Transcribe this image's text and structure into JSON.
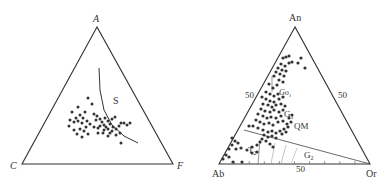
{
  "caption_top_fragment": "",
  "left_diagram": {
    "apex_labels": {
      "top": "A",
      "left": "C",
      "right": "F"
    },
    "region_label": "S",
    "vertices": {
      "top": [
        97,
        27
      ],
      "left": [
        22,
        164
      ],
      "right": [
        173,
        164
      ]
    },
    "boundary_curve": [
      [
        99,
        68
      ],
      [
        100,
        90
      ],
      [
        104,
        110
      ],
      [
        112,
        125
      ],
      [
        124,
        136
      ],
      [
        138,
        143
      ]
    ],
    "points": [
      [
        88,
        98
      ],
      [
        78,
        107
      ],
      [
        72,
        112
      ],
      [
        92,
        104
      ],
      [
        85,
        112
      ],
      [
        94,
        114
      ],
      [
        97,
        116
      ],
      [
        80,
        115
      ],
      [
        76,
        118
      ],
      [
        83,
        118
      ],
      [
        70,
        120
      ],
      [
        74,
        122
      ],
      [
        78,
        121
      ],
      [
        82,
        123
      ],
      [
        87,
        121
      ],
      [
        90,
        124
      ],
      [
        96,
        120
      ],
      [
        100,
        119
      ],
      [
        102,
        122
      ],
      [
        105,
        118
      ],
      [
        108,
        121
      ],
      [
        104,
        125
      ],
      [
        100,
        126
      ],
      [
        106,
        127
      ],
      [
        110,
        124
      ],
      [
        112,
        119
      ],
      [
        115,
        117
      ],
      [
        113,
        127
      ],
      [
        108,
        129
      ],
      [
        104,
        130
      ],
      [
        98,
        128
      ],
      [
        94,
        127
      ],
      [
        86,
        127
      ],
      [
        80,
        129
      ],
      [
        74,
        130
      ],
      [
        69,
        126
      ],
      [
        84,
        131
      ],
      [
        88,
        134
      ],
      [
        82,
        137
      ],
      [
        77,
        134
      ],
      [
        112,
        131
      ],
      [
        116,
        129
      ],
      [
        119,
        126
      ],
      [
        121,
        123
      ],
      [
        124,
        123
      ],
      [
        127,
        125
      ],
      [
        130,
        123
      ],
      [
        116,
        135
      ],
      [
        120,
        133
      ],
      [
        110,
        133
      ],
      [
        121,
        143
      ],
      [
        108,
        136
      ],
      [
        103,
        133
      ],
      [
        98,
        133
      ]
    ]
  },
  "right_diagram": {
    "apex_labels": {
      "top": "An",
      "left": "Ab",
      "right": "Or"
    },
    "tick_labels": {
      "left_edge": "50",
      "right_edge": "50",
      "base": "50"
    },
    "field_labels": {
      "QM": "QM",
      "G1": "G",
      "G1_sub": "1",
      "G2": "G",
      "G2_sub": "2",
      "T2": "T",
      "T2_sub": "2",
      "Go1": "Go",
      "Go1_sub": "1"
    },
    "vertices": {
      "top": [
        295,
        27
      ],
      "left": [
        219,
        164
      ],
      "right": [
        370,
        164
      ]
    },
    "divider_line": [
      [
        244,
        130
      ],
      [
        370,
        164
      ]
    ],
    "points": [
      [
        283,
        58
      ],
      [
        286,
        57
      ],
      [
        289,
        56
      ],
      [
        292,
        62
      ],
      [
        281,
        64
      ],
      [
        285,
        66
      ],
      [
        289,
        63
      ],
      [
        278,
        68
      ],
      [
        282,
        70
      ],
      [
        286,
        71
      ],
      [
        276,
        72
      ],
      [
        280,
        74
      ],
      [
        284,
        76
      ],
      [
        298,
        63
      ],
      [
        301,
        58
      ],
      [
        305,
        68
      ],
      [
        274,
        76
      ],
      [
        279,
        80
      ],
      [
        283,
        82
      ],
      [
        269,
        84
      ],
      [
        277,
        85
      ],
      [
        273,
        88
      ],
      [
        266,
        92
      ],
      [
        270,
        94
      ],
      [
        274,
        96
      ],
      [
        278,
        94
      ],
      [
        262,
        97
      ],
      [
        266,
        99
      ],
      [
        270,
        101
      ],
      [
        274,
        102
      ],
      [
        279,
        99
      ],
      [
        283,
        97
      ],
      [
        263,
        104
      ],
      [
        268,
        105
      ],
      [
        272,
        107
      ],
      [
        276,
        105
      ],
      [
        281,
        104
      ],
      [
        285,
        106
      ],
      [
        261,
        109
      ],
      [
        265,
        111
      ],
      [
        270,
        112
      ],
      [
        274,
        110
      ],
      [
        279,
        112
      ],
      [
        283,
        110
      ],
      [
        258,
        114
      ],
      [
        263,
        116
      ],
      [
        267,
        118
      ],
      [
        271,
        117
      ],
      [
        276,
        118
      ],
      [
        281,
        116
      ],
      [
        256,
        120
      ],
      [
        260,
        122
      ],
      [
        264,
        124
      ],
      [
        269,
        123
      ],
      [
        273,
        125
      ],
      [
        278,
        122
      ],
      [
        283,
        121
      ],
      [
        287,
        124
      ],
      [
        291,
        122
      ],
      [
        288,
        127
      ],
      [
        284,
        129
      ],
      [
        280,
        131
      ],
      [
        276,
        133
      ],
      [
        272,
        131
      ],
      [
        268,
        132
      ],
      [
        263,
        130
      ],
      [
        258,
        128
      ],
      [
        253,
        126
      ],
      [
        249,
        126
      ],
      [
        264,
        135
      ],
      [
        268,
        137
      ],
      [
        272,
        136
      ],
      [
        276,
        138
      ],
      [
        282,
        134
      ],
      [
        286,
        132
      ],
      [
        289,
        118
      ],
      [
        292,
        115
      ],
      [
        232,
        138
      ],
      [
        235,
        141
      ],
      [
        238,
        143
      ],
      [
        232,
        145
      ],
      [
        229,
        149
      ],
      [
        236,
        149
      ],
      [
        241,
        148
      ],
      [
        247,
        150
      ],
      [
        252,
        147
      ],
      [
        257,
        145
      ],
      [
        260,
        142
      ],
      [
        262,
        139
      ],
      [
        266,
        141
      ],
      [
        270,
        144
      ],
      [
        273,
        147
      ],
      [
        226,
        155
      ],
      [
        229,
        157
      ],
      [
        223,
        159
      ],
      [
        233,
        162
      ],
      [
        242,
        162
      ],
      [
        252,
        153
      ],
      [
        257,
        152
      ]
    ]
  }
}
